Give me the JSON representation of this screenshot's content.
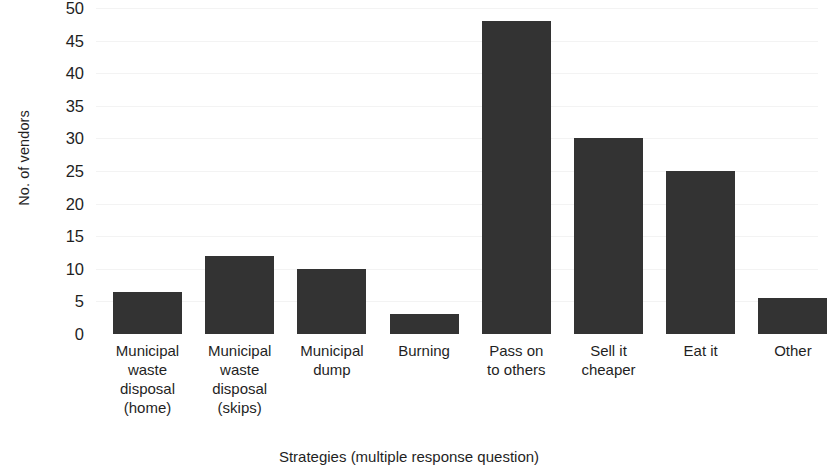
{
  "chart_data": {
    "type": "bar",
    "title": "",
    "xlabel": "Strategies (multiple response question)",
    "ylabel": "No. of vendors",
    "categories": [
      "Municipal\nwaste\ndisposal\n(home)",
      "Municipal\nwaste\ndisposal\n(skips)",
      "Municipal\ndump",
      "Burning",
      "Pass on\nto others",
      "Sell it\ncheaper",
      "Eat it",
      "Other"
    ],
    "values": [
      6.5,
      12,
      10,
      3,
      48,
      30,
      25,
      5.5
    ],
    "ylim": [
      0,
      50
    ],
    "yticks": [
      0,
      5,
      10,
      15,
      20,
      25,
      30,
      35,
      40,
      45,
      50
    ],
    "ytick_labels": [
      "0",
      "5",
      "10",
      "15",
      "20",
      "25",
      "30",
      "35",
      "40",
      "45",
      "50"
    ],
    "grid": true,
    "legend": false,
    "bar_color": "#333333",
    "background_color": "#ffffff",
    "axis_text_color": "#1f1f1f"
  }
}
